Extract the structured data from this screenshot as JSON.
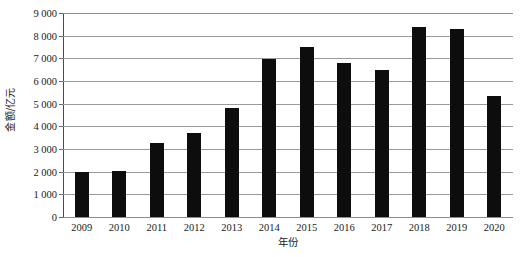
{
  "chart_data": {
    "type": "bar",
    "title": "",
    "subtitle": "",
    "xlabel": "年份",
    "ylabel": "金额/亿元",
    "categories": [
      "2009",
      "2010",
      "2011",
      "2012",
      "2013",
      "2014",
      "2015",
      "2016",
      "2017",
      "2018",
      "2019",
      "2020"
    ],
    "values": [
      2000,
      2050,
      3250,
      3700,
      4820,
      6950,
      7500,
      6800,
      6500,
      8400,
      8300,
      5350
    ],
    "series": [
      {
        "name": "金额/亿元",
        "values": [
          2000,
          2050,
          3250,
          3700,
          4820,
          6950,
          7500,
          6800,
          6500,
          8400,
          8300,
          5350
        ]
      }
    ],
    "ylim": [
      0,
      9000
    ],
    "ytick_values": [
      0,
      1000,
      2000,
      3000,
      4000,
      5000,
      6000,
      7000,
      8000,
      9000
    ],
    "ytick_labels": [
      "0",
      "1 000",
      "2 000",
      "3 000",
      "4 000",
      "5 000",
      "6 000",
      "7 000",
      "8 000",
      "9 000"
    ],
    "grid": true,
    "grid_axis": "y",
    "legend": false,
    "legend_position": "none",
    "bar_color": "#0d0d0d",
    "grid_color": "#9a9a9a",
    "background_color": "#ffffff",
    "annotations": []
  }
}
